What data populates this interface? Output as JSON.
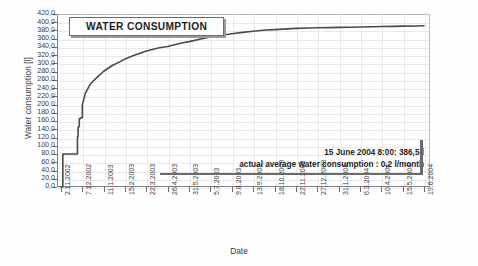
{
  "chart_data": {
    "type": "line",
    "title": "WATER CONSUMPTION",
    "xlabel": "Date",
    "ylabel": "Water consumption [l]",
    "ylim": [
      0.0,
      420.0
    ],
    "ytick_step": 20.0,
    "grid": true,
    "legend": "none",
    "ytick_labels": [
      "420,0",
      "400,0",
      "380,0",
      "360,0",
      "340,0",
      "320,0",
      "300,0",
      "280,0",
      "260,0",
      "240,0",
      "220,0",
      "200,0",
      "180,0",
      "160,0",
      "140,0",
      "120,0",
      "100,0",
      "80,0",
      "60,0",
      "40,0",
      "20,0",
      "0,0"
    ],
    "categories": [
      "2.11.2002",
      "7.12.2002",
      "11.1.2003",
      "15.2.2003",
      "22.3.2003",
      "26.4.2003",
      "31.5.2003",
      "5.7.2003",
      "9.8.2003",
      "13.9.2003",
      "18.10.2003",
      "22.11.2003",
      "27.12.2003",
      "31.1.2004",
      "6.3.2004",
      "10.4.2004",
      "15.5.2004",
      "19.6.2004"
    ],
    "series": [
      {
        "name": "Cumulative water consumption",
        "x": [
          "2.11.2002",
          "5.11.2002",
          "20.11.2002",
          "28.11.2002",
          "29.11.2002",
          "30.11.2002",
          "1.12.2002",
          "2.12.2002",
          "4.12.2002",
          "7.12.2002",
          "12.12.2002",
          "20.12.2002",
          "31.12.2002",
          "11.1.2003",
          "25.1.2003",
          "8.2.2003",
          "15.2.2003",
          "1.3.2003",
          "22.3.2003",
          "12.4.2003",
          "26.4.2003",
          "17.5.2003",
          "31.5.2003",
          "21.6.2003",
          "5.7.2003",
          "26.7.2003",
          "9.8.2003",
          "30.8.2003",
          "13.9.2003",
          "4.10.2003",
          "18.10.2003",
          "8.11.2003",
          "22.11.2003",
          "13.12.2003",
          "27.12.2003",
          "17.1.2004",
          "31.1.2004",
          "21.2.2004",
          "6.3.2004",
          "27.3.2004",
          "10.4.2004",
          "1.5.2004",
          "15.5.2004",
          "5.6.2004",
          "19.6.2004"
        ],
        "values": [
          0.0,
          80.0,
          80.0,
          80.0,
          122.0,
          145.0,
          147.0,
          166.0,
          168.0,
          200.0,
          228.0,
          250.0,
          266.0,
          281.0,
          295.0,
          305.0,
          311.0,
          319.0,
          330.0,
          338.0,
          341.0,
          349.0,
          353.0,
          360.0,
          364.0,
          369.0,
          372.0,
          376.0,
          378.0,
          381.0,
          382.0,
          384.0,
          385.0,
          386.0,
          386.5,
          387.0,
          387.5,
          388.0,
          388.5,
          389.0,
          389.5,
          390.0,
          390.5,
          391.0,
          391.5
        ]
      }
    ],
    "annotations": [
      "15 June 2004  8:00: 386,5 l",
      "actual average water consumption : 0,2 l/month"
    ],
    "final_value": "386,5 l",
    "final_timestamp": "15 June 2004  8:00",
    "average_rate": "0,2 l/month"
  },
  "colors": {
    "curve": "#4a4a4a",
    "axis": "#7d7d7d",
    "grid": "#e9e9ec",
    "text": "#1d1d1d",
    "background": "#fefefe"
  }
}
